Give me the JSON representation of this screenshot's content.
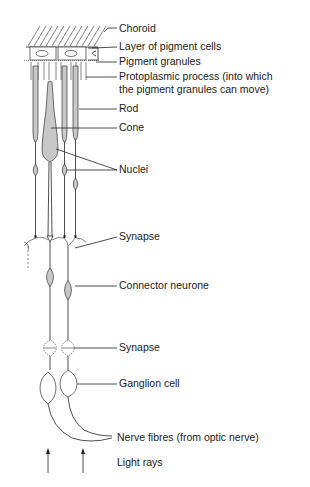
{
  "diagram": {
    "type": "anatomical-illustration",
    "labels": {
      "choroid": "Choroid",
      "pigment_layer": "Layer of pigment cells",
      "pigment_granules": "Pigment granules",
      "protoplasmic_1": "Protoplasmic process (into which",
      "protoplasmic_2": "the pigment granules can move)",
      "rod": "Rod",
      "cone": "Cone",
      "nuclei": "Nuclei",
      "synapse_upper": "Synapse",
      "connector": "Connector neurone",
      "synapse_lower": "Synapse",
      "ganglion": "Ganglion cell",
      "nerve_fibres": "Nerve fibres (from optic nerve)",
      "light_rays": "Light rays"
    },
    "colors": {
      "line": "#222222",
      "cell_fill": "#c8c8c8",
      "background": "#ffffff"
    }
  }
}
